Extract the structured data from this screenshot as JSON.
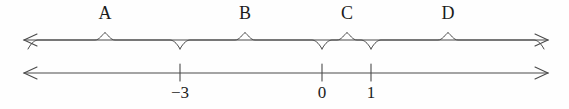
{
  "figure": {
    "type": "number-line-with-braces",
    "background_color": "#fefefe",
    "stroke_color": "#4a4a4a",
    "text_color": "#1c1c1c"
  },
  "brace_axis": {
    "y": 40,
    "left_arrow_x": 24,
    "right_arrow_x": 548,
    "has_left_arrow": true,
    "has_right_arrow": true
  },
  "number_axis": {
    "y": 73,
    "left_arrow_x": 24,
    "right_arrow_x": 548,
    "has_left_arrow": true,
    "has_right_arrow": true,
    "tick_top": 64,
    "tick_bottom": 81
  },
  "ticks": [
    {
      "value": "-3",
      "label": "−3",
      "x": 180
    },
    {
      "value": "0",
      "label": "0",
      "x": 322
    },
    {
      "value": "1",
      "label": "1",
      "x": 371
    }
  ],
  "intervals": [
    {
      "label": "A",
      "label_x": 105,
      "start_x": 28,
      "end_x": 180,
      "peak_x": 105
    },
    {
      "label": "B",
      "label_x": 245,
      "start_x": 180,
      "end_x": 322,
      "peak_x": 245
    },
    {
      "label": "C",
      "label_x": 347,
      "start_x": 322,
      "end_x": 371,
      "peak_x": 347
    },
    {
      "label": "D",
      "label_x": 448,
      "start_x": 371,
      "end_x": 544,
      "peak_x": 448
    }
  ]
}
